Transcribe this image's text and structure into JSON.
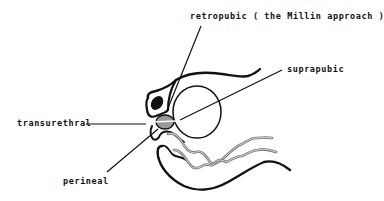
{
  "figure": {
    "type": "anatomical-schematic",
    "labels": {
      "retropubic": "retropubic ( the Millin approach )",
      "suprapubic": "suprapubic",
      "transurethral": "transurethral",
      "perineal": "perineal"
    },
    "structures": [
      "bladder",
      "prostate",
      "pubic-bone",
      "urethra",
      "rectum",
      "abdominal-wall",
      "vas-deferens-tubes"
    ],
    "colors": {
      "line": "#111111",
      "tube": "#8a8a8a",
      "prostate_fill": "#9a9a9a",
      "background": "#ffffff"
    }
  }
}
